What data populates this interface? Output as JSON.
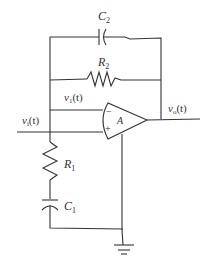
{
  "diagram": {
    "type": "op-amp circuit",
    "labels": {
      "c2": "C",
      "c2_sub": "2",
      "r2": "R",
      "r2_sub": "2",
      "v1": "v",
      "v1_sub": "1",
      "v1_arg": "(t)",
      "vi": "v",
      "vi_sub": "i",
      "vi_arg": "(t)",
      "vo": "v",
      "vo_sub": "o",
      "vo_arg": "(t)",
      "opamp_gain": "A",
      "opamp_minus": "−",
      "opamp_plus": "+",
      "r1": "R",
      "r1_sub": "1",
      "c1": "C",
      "c1_sub": "1"
    },
    "components": [
      {
        "id": "C2",
        "kind": "capacitor",
        "position": "top feedback"
      },
      {
        "id": "R2",
        "kind": "resistor",
        "position": "middle feedback"
      },
      {
        "id": "A",
        "kind": "op-amp"
      },
      {
        "id": "R1",
        "kind": "resistor",
        "position": "shunt to ground"
      },
      {
        "id": "C1",
        "kind": "capacitor",
        "position": "shunt to ground"
      },
      {
        "id": "GND",
        "kind": "ground"
      }
    ]
  }
}
